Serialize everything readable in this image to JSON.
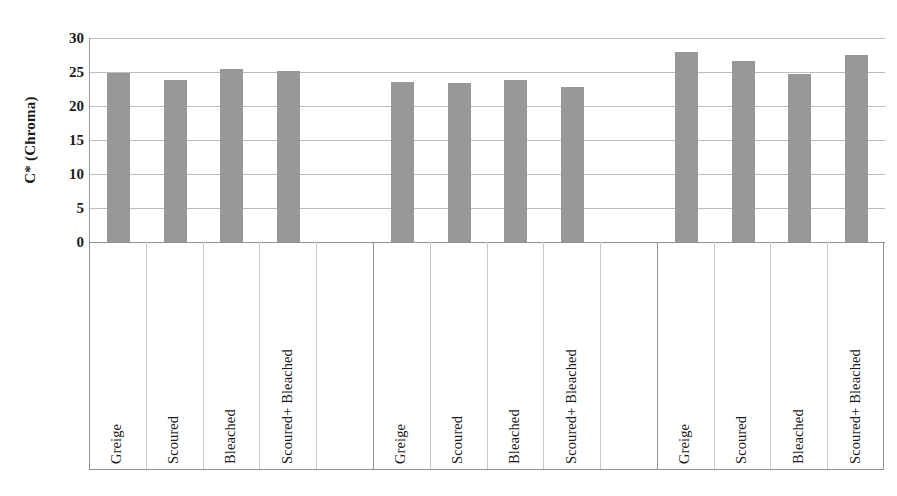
{
  "chart_data": {
    "type": "bar",
    "title": "",
    "xlabel": "",
    "ylabel": "C* (Chroma)",
    "ylim": [
      0,
      30
    ],
    "ytick_step": 5,
    "yticks": [
      30,
      25,
      20,
      15,
      10,
      5,
      0
    ],
    "grid": true,
    "legend": "none",
    "bar_color": "#989898",
    "grid_color": "#bdbdbd",
    "axis_color": "#8f8f8f",
    "groups": [
      {
        "name": "Group 1",
        "categories": [
          "Greige",
          "Scoured",
          "Bleached",
          "Scoured+ Bleached",
          ""
        ],
        "values": [
          24.8,
          23.8,
          25.4,
          25.1,
          null
        ]
      },
      {
        "name": "Group 2",
        "categories": [
          "Greige",
          "Scoured",
          "Bleached",
          "Scoured+ Bleached",
          ""
        ],
        "values": [
          23.5,
          23.3,
          23.7,
          22.7,
          null
        ]
      },
      {
        "name": "Group 3",
        "categories": [
          "Greige",
          "Scoured",
          "Bleached",
          "Scoured+ Bleached"
        ],
        "values": [
          27.9,
          26.6,
          24.7,
          27.5
        ]
      }
    ],
    "categories": [
      "Greige",
      "Scoured",
      "Bleached",
      "Scoured+ Bleached",
      "",
      "Greige",
      "Scoured",
      "Bleached",
      "Scoured+ Bleached",
      "",
      "Greige",
      "Scoured",
      "Bleached",
      "Scoured+ Bleached"
    ],
    "values": [
      24.8,
      23.8,
      25.4,
      25.1,
      null,
      23.5,
      23.3,
      23.7,
      22.7,
      null,
      27.9,
      26.6,
      24.7,
      27.5
    ]
  }
}
